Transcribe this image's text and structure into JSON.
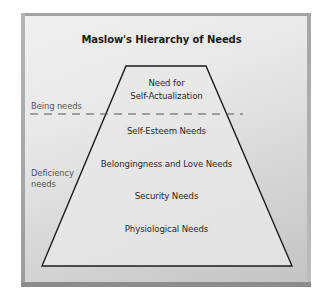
{
  "title": "Maslow's Hierarchy of Needs",
  "pyramid": {
    "levels": [
      {
        "line1": "Need for",
        "line2": "Self-Actualization"
      },
      {
        "label": "Self-Esteem Needs"
      },
      {
        "label": "Belongingness and Love Needs"
      },
      {
        "label": "Security Needs"
      },
      {
        "label": "Physiological Needs"
      }
    ]
  },
  "groups": {
    "being": {
      "label": "Being needs"
    },
    "deficiency": {
      "line1": "Deficiency",
      "line2": "needs"
    }
  },
  "colors": {
    "outline": "#1c1c1c",
    "dashed_line": "#555555",
    "pyramid_fill": "#e7e7e7",
    "frame_border": "#a9a9a9"
  }
}
